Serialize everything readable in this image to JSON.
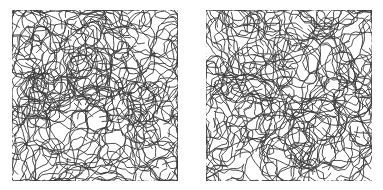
{
  "figure": {
    "panels": [
      {
        "id": "left",
        "pattern": "labyrinth-squiggles",
        "seed": 17
      },
      {
        "id": "right",
        "pattern": "labyrinth-squiggles",
        "seed": 42
      }
    ],
    "colors": {
      "background": "#ffffff",
      "stroke": "#3a3a3a"
    }
  }
}
